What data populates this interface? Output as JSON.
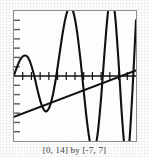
{
  "figure": {
    "caption": "[0, 14] by [-7, 7]",
    "frame_color": "#8e8e8e",
    "curve_color": "#111111",
    "line_color": "#111111",
    "background": "#ffffff"
  },
  "chart_data": {
    "type": "line",
    "title": "",
    "subtitle": "",
    "xlabel": "",
    "ylabel": "",
    "xlim": [
      0,
      14
    ],
    "ylim": [
      -7,
      7
    ],
    "grid": false,
    "legend": null,
    "axis": {
      "x_axis_drawn": true,
      "y_axis_drawn": false,
      "x_tick_interval": 1,
      "y_tick_interval": 1,
      "x_ticks": [
        1,
        2,
        3,
        4,
        5,
        6,
        7,
        8,
        9,
        10,
        11,
        12,
        13
      ],
      "y_ticks": [
        -6,
        -5,
        -4,
        -3,
        -2,
        -1,
        1,
        2,
        3,
        4,
        5,
        6
      ],
      "tick_labels_shown": false
    },
    "series": [
      {
        "name": "oscillating-curve",
        "type": "line",
        "x": [
          0.0,
          0.4,
          0.8,
          1.2,
          1.6,
          2.0,
          2.4,
          2.8,
          3.2,
          3.6,
          4.0,
          4.4,
          4.8,
          5.2,
          5.6,
          6.0,
          6.4,
          6.8,
          7.2,
          7.6,
          8.0,
          8.4,
          8.8,
          9.2,
          9.6,
          10.0,
          10.4,
          10.8,
          11.2,
          11.6,
          12.0,
          12.4,
          12.8,
          13.2,
          13.6,
          14.0
        ],
        "y": [
          0.1,
          1.1,
          1.9,
          2.2,
          2.0,
          1.1,
          -0.3,
          -1.9,
          -3.2,
          -3.8,
          -3.5,
          -2.3,
          -0.3,
          2.2,
          4.7,
          6.6,
          7.4,
          6.9,
          5.0,
          2.0,
          -1.6,
          -5.1,
          -7.5,
          -8.0,
          -6.2,
          -2.3,
          2.7,
          7.0,
          8.5,
          6.5,
          1.5,
          -4.5,
          -8.5,
          -7.5,
          -1.5,
          6.0
        ]
      },
      {
        "name": "straight-line",
        "type": "line",
        "x": [
          0,
          14
        ],
        "y": [
          -4.4,
          0.6
        ]
      }
    ]
  }
}
